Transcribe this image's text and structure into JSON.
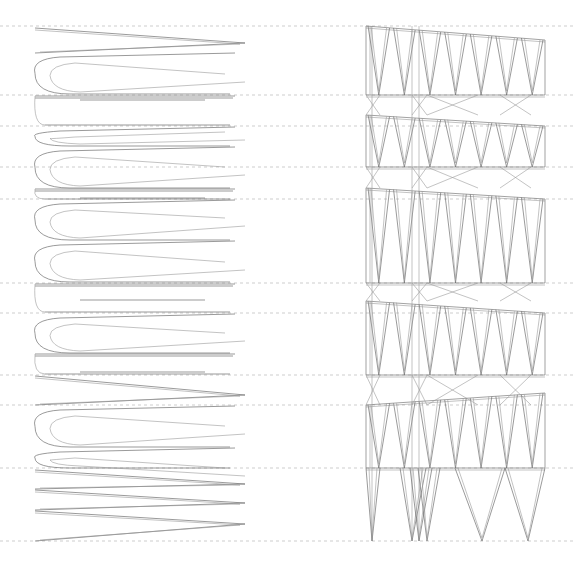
{
  "drawing": {
    "width": 576,
    "height": 579,
    "background": "#ffffff",
    "line_color": "#6e6e6e",
    "dash_color": "#b8b8b8"
  },
  "level_lines": {
    "x_start": 0,
    "x_end": 576,
    "y": [
      26,
      95,
      126,
      167,
      199,
      283,
      313,
      375,
      405,
      468,
      541
    ]
  },
  "ramp_section": {
    "left_x": 35,
    "inner_x": 50,
    "right_x": 245,
    "strokes": [
      {
        "y1": 28,
        "y2": 43,
        "y3": 53,
        "type": "v"
      },
      {
        "y1": 53,
        "y2": 74,
        "y3": 94,
        "type": "loop"
      },
      {
        "y1": 96,
        "y2": 100,
        "y3": 125,
        "type": "flat"
      },
      {
        "y1": 127,
        "y2": 132,
        "y3": 146,
        "type": "loop"
      },
      {
        "y1": 147,
        "y2": 167,
        "y3": 188,
        "type": "loop"
      },
      {
        "y1": 189,
        "y2": 198,
        "y3": 199,
        "type": "flat"
      },
      {
        "y1": 200,
        "y2": 218,
        "y3": 240,
        "type": "loop"
      },
      {
        "y1": 241,
        "y2": 262,
        "y3": 282,
        "type": "loop"
      },
      {
        "y1": 284,
        "y2": 300,
        "y3": 312,
        "type": "flat"
      },
      {
        "y1": 314,
        "y2": 333,
        "y3": 353,
        "type": "loop"
      },
      {
        "y1": 354,
        "y2": 372,
        "y3": 374,
        "type": "flat"
      },
      {
        "y1": 376,
        "y2": 395,
        "y3": 405,
        "type": "v"
      },
      {
        "y1": 406,
        "y2": 426,
        "y3": 447,
        "type": "loop"
      },
      {
        "y1": 448,
        "y2": 468,
        "y3": 468,
        "type": "loop"
      },
      {
        "y1": 470,
        "y2": 484,
        "y3": 489,
        "type": "v"
      },
      {
        "y1": 490,
        "y2": 503,
        "y3": 510,
        "type": "v"
      },
      {
        "y1": 511,
        "y2": 524,
        "y3": 541,
        "type": "v"
      }
    ]
  },
  "frame_section": {
    "left_x": 366,
    "right_x": 545,
    "columns_x": [
      366,
      372,
      412,
      419,
      427,
      470,
      500,
      523,
      545
    ],
    "tiers": [
      {
        "top": 26,
        "top_right": 40,
        "bottom": 95
      },
      {
        "top": 115,
        "top_right": 126,
        "bottom": 167
      },
      {
        "top": 188,
        "top_right": 199,
        "bottom": 283
      },
      {
        "top": 301,
        "top_right": 313,
        "bottom": 375
      },
      {
        "top": 405,
        "top_right": 393,
        "bottom": 468
      }
    ],
    "feet_y": 541,
    "feet_x": [
      372,
      412,
      419,
      427,
      482,
      528
    ]
  }
}
